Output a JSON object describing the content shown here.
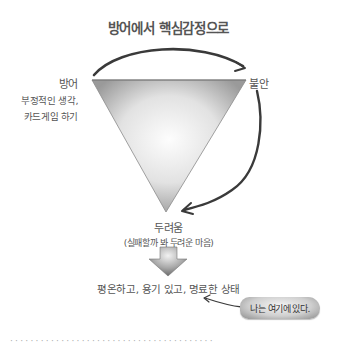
{
  "diagram": {
    "title": "방어에서 핵심감정으로",
    "defense": {
      "label": "방어",
      "examples": [
        "부정적인 생각,",
        "카드게임 하기"
      ]
    },
    "anxiety": {
      "label": "불안"
    },
    "fear": {
      "label": "두려움",
      "description": "(실패할까 봐 두려운 마음)"
    },
    "result_state": "평온하고, 용기 있고, 명료한 상태",
    "callout": "나는 여기에 있다.",
    "cutoff_text": "· · · · · · · · · · · · · · · · · · · · · · · · · · · · · · · · · · · · · · · ·"
  },
  "colors": {
    "text": "#555555",
    "arrow": "#3a3a3a",
    "triangle_light": "#fafafa",
    "triangle_dark": "#9a9a9a"
  }
}
